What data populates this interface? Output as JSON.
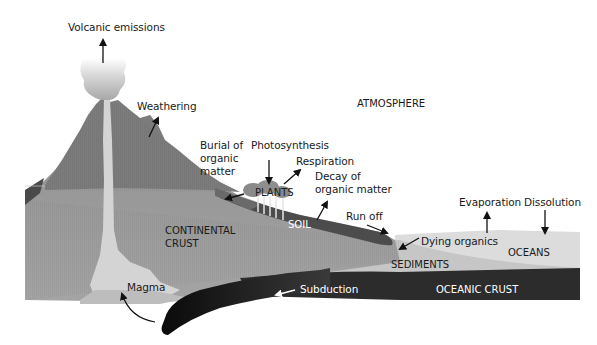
{
  "diagram": {
    "colors": {
      "background": "#ffffff",
      "volcano": "#7a7a7a",
      "continental_crust": "#9a9a9a",
      "magma": "#d2d2d2",
      "soil": "#4a4a4a",
      "plants": "#8a8a8a",
      "oceans": "#dcdcdc",
      "sediments": "#c4c4c4",
      "oceanic_crust": "#2a2a2a",
      "subducting_slab": "#111111",
      "text": "#1a1a1a",
      "arrow": "#111111"
    },
    "labels": {
      "volcanic_emissions": "Volcanic emissions",
      "weathering": "Weathering",
      "atmosphere": "ATMOSPHERE",
      "burial_line1": "Burial of",
      "burial_line2": "organic",
      "burial_line3": "matter",
      "photosynthesis": "Photosynthesis",
      "respiration": "Respiration",
      "decay_line1": "Decay of",
      "decay_line2": "organic matter",
      "plants": "PLANTS",
      "soil": "SOIL",
      "continental_line1": "CONTINENTAL",
      "continental_line2": "CRUST",
      "run_off": "Run off",
      "evaporation": "Evaporation",
      "dissolution": "Dissolution",
      "dying_organics": "Dying organics",
      "oceans": "OCEANS",
      "sediments": "SEDIMENTS",
      "magma": "Magma",
      "subduction": "Subduction",
      "oceanic_crust": "OCEANIC CRUST"
    }
  }
}
